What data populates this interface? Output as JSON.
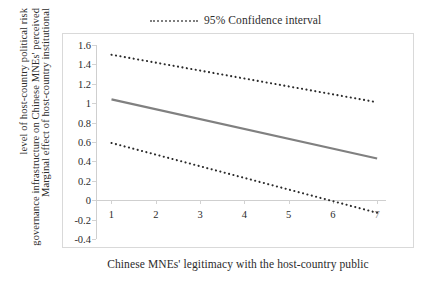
{
  "legend": {
    "marker": "dotted-line-marker",
    "label": "95% Confidence interval"
  },
  "y_axis_title_lines": [
    "Marginal effect of host-country institutional",
    "governance infrastructure on Chinese MNEs' perceived",
    "level of host-country political risk"
  ],
  "x_axis_title": "Chinese MNEs' legitimacy with the host-country public",
  "chart_data": {
    "type": "line",
    "title": "",
    "xlabel": "Chinese MNEs' legitimacy with the host-country public",
    "ylabel": "Marginal effect of host-country institutional governance infrastructure on Chinese MNEs' perceived level of host-country political risk",
    "x": [
      1,
      7
    ],
    "xlim": [
      0.65,
      7.2
    ],
    "ylim": [
      -0.4,
      1.6
    ],
    "xticks": [
      1,
      2,
      3,
      4,
      5,
      6,
      7
    ],
    "xticklabels": [
      "1",
      "2",
      "3",
      "4",
      "5",
      "6",
      "7"
    ],
    "yticks": [
      -0.4,
      -0.2,
      0,
      0.2,
      0.4,
      0.6,
      0.8,
      1,
      1.2,
      1.4,
      1.6
    ],
    "yticklabels": [
      "-0.4",
      "-0.2",
      "0",
      "0.2",
      "0.4",
      "0.6",
      "0.8",
      "1",
      "1.2",
      "1.4",
      "1.6"
    ],
    "grid": false,
    "zero_reference_line": 0,
    "legend_position": "top-center",
    "series": [
      {
        "name": "Marginal effect",
        "style": "solid",
        "color": "#808080",
        "x": [
          1,
          7
        ],
        "values": [
          1.04,
          0.43
        ]
      },
      {
        "name": "95% Confidence interval upper",
        "style": "dotted",
        "color": "#2b2b2b",
        "x": [
          1,
          7
        ],
        "values": [
          1.5,
          1.01
        ]
      },
      {
        "name": "95% Confidence interval lower",
        "style": "dotted",
        "color": "#2b2b2b",
        "x": [
          1,
          7
        ],
        "values": [
          0.59,
          -0.13
        ]
      }
    ]
  }
}
